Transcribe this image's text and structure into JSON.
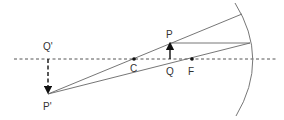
{
  "diagram": {
    "colors": {
      "line": "#666666",
      "axis": "#555555",
      "arrow": "#111111",
      "label": "#333333",
      "mirror": "#777777"
    },
    "labels": {
      "object_tip": "P",
      "object_base": "Q",
      "image_tip": "P'",
      "image_base": "Q'",
      "center_of_curvature": "C",
      "focus": "F"
    },
    "points": {
      "C": [
        134,
        59
      ],
      "F": [
        192,
        59
      ],
      "Q": [
        170,
        59
      ],
      "P": [
        170,
        43
      ],
      "Q_prime": [
        48,
        59
      ],
      "P_prime": [
        48,
        94
      ],
      "mirror_vertex": [
        252,
        59
      ]
    },
    "objects": {
      "object_arrow": "solid upward arrow from Q to P",
      "image_arrow": "dashed downward arrow from Q' to P' (real, inverted, magnified)"
    },
    "rays": [
      "From P' through C to mirror (reflects back along itself)",
      "From P parallel to axis to mirror, reflects through F to P'"
    ],
    "principal_axis": "dashed horizontal line"
  }
}
